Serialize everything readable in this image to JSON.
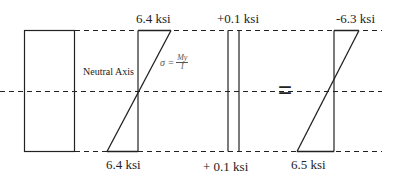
{
  "diagram": {
    "labels": {
      "neutral_axis": "Neutral Axis",
      "bending_top": "6.4 ksi",
      "bending_bottom": "6.4 ksi",
      "axial_top": "+0.1 ksi",
      "axial_bottom": "+ 0.1 ksi",
      "result_top": "-6.3 ksi",
      "result_bottom": "6.5 ksi",
      "equals": "="
    },
    "formula": {
      "lhs": "σ =",
      "numerator": "My",
      "denominator": "I"
    },
    "line_color": "#222222"
  }
}
